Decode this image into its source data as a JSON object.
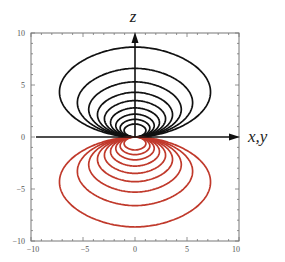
{
  "chart_data": {
    "type": "line",
    "title": "",
    "subtitle": "Contour plot of two lobes (positive lobe above, negative lobe below the x,y plane)",
    "xlabel": "x, y",
    "ylabel": "z",
    "xlim": [
      -10,
      10
    ],
    "ylim": [
      -10,
      10
    ],
    "x_ticks": [
      -10,
      -5,
      0,
      5,
      10
    ],
    "y_ticks": [
      -10,
      -5,
      0,
      5,
      10
    ],
    "x_tick_labels": [
      "-10",
      "-5",
      "0",
      "5",
      "10"
    ],
    "y_tick_labels": [
      "-10",
      "-5",
      "0",
      "5",
      "10"
    ],
    "grid": false,
    "legend": null,
    "series": [
      {
        "name": "positive lobe contours",
        "color": "#111111",
        "region": "z > 0",
        "contour_top_z": [
          8.65,
          6.6,
          5.3,
          4.3,
          3.5,
          2.8,
          2.2,
          1.7,
          1.25
        ],
        "outer_half_width": 6.3
      },
      {
        "name": "negative lobe contours",
        "color": "#c0392b",
        "region": "z < 0",
        "contour_bottom_z": [
          -8.65,
          -6.6,
          -5.3,
          -4.3,
          -3.5,
          -2.8,
          -2.2,
          -1.7,
          -1.25
        ],
        "outer_half_width": 6.3
      }
    ],
    "annotations": [
      {
        "type": "arrow",
        "direction": "up",
        "label": "z"
      },
      {
        "type": "arrow",
        "direction": "right",
        "label": "x,y"
      }
    ]
  },
  "labels": {
    "z_axis": "z",
    "xy_axis": "x,y"
  },
  "ticks": {
    "x": [
      "−10",
      "−5",
      "0",
      "5",
      "10"
    ],
    "y": [
      "10",
      "5",
      "0",
      "−5",
      "−10"
    ]
  },
  "colors": {
    "positive": "#111111",
    "negative": "#c0392b",
    "frame": "#666666"
  }
}
